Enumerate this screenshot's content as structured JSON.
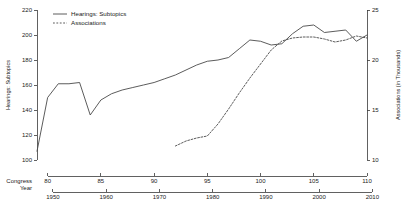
{
  "chart_data": {
    "type": "line",
    "title": "",
    "xlabel": "Congress",
    "ylabel": "Hearings: Subtopics",
    "y2label": "Associations (in Thousands)",
    "grid": false,
    "legend_position": "top-left",
    "x_axes": [
      {
        "name": "Congress",
        "label": "Congress",
        "ticks": [
          80,
          85,
          90,
          95,
          100,
          105,
          110
        ],
        "tick_labels": [
          "80",
          "85",
          "90",
          "95",
          "100",
          "105",
          "110"
        ],
        "range": [
          79,
          110
        ]
      },
      {
        "name": "Year",
        "label": "Year",
        "ticks": [
          1950,
          1960,
          1970,
          1980,
          1990,
          2000,
          2010
        ],
        "tick_labels": [
          "1950",
          "1960",
          "1970",
          "1980",
          "1990",
          "2000",
          "2010"
        ],
        "range": [
          1947,
          2009
        ]
      }
    ],
    "y_axis_left": {
      "label": "Hearings: Subtopics",
      "ticks": [
        100,
        120,
        140,
        160,
        180,
        200,
        220
      ],
      "tick_labels": [
        "100",
        "120",
        "140",
        "160",
        "180",
        "200",
        "220"
      ],
      "range": [
        100,
        220
      ]
    },
    "y_axis_right": {
      "label": "Associations (in Thousands)",
      "ticks": [
        10,
        15,
        20,
        25
      ],
      "tick_labels": [
        "10",
        "15",
        "20",
        "25"
      ],
      "range": [
        10,
        25
      ]
    },
    "series": [
      {
        "name": "Hearings: Subtopics",
        "style": "solid",
        "axis": "left",
        "color": "#4a4a4a",
        "x": [
          79,
          80,
          81,
          82,
          83,
          84,
          85,
          86,
          87,
          88,
          89,
          90,
          91,
          92,
          93,
          94,
          95,
          96,
          97,
          98,
          99,
          100,
          101,
          102,
          103,
          104,
          105,
          106,
          107,
          108,
          109,
          110
        ],
        "values": [
          107,
          150,
          161,
          161,
          162,
          136,
          148,
          153,
          156,
          158,
          160,
          162,
          165,
          168,
          172,
          176,
          179,
          180,
          182,
          189,
          196,
          195,
          192,
          193,
          201,
          207,
          208,
          202,
          203,
          204,
          195,
          200
        ]
      },
      {
        "name": "Associations",
        "style": "dashed",
        "axis": "right",
        "color": "#4a4a4a",
        "x": [
          92,
          93,
          94,
          95,
          96,
          97,
          98,
          99,
          100,
          101,
          102,
          103,
          104,
          105,
          106,
          107,
          108,
          109,
          110
        ],
        "values": [
          11.4,
          11.9,
          12.2,
          12.4,
          13.6,
          15.1,
          16.7,
          18.2,
          19.6,
          21.0,
          21.9,
          22.2,
          22.3,
          22.3,
          22.1,
          21.8,
          22.0,
          22.4,
          22.2
        ]
      }
    ],
    "legend": [
      {
        "label": "Hearings: Subtopics",
        "style": "solid"
      },
      {
        "label": "Associations",
        "style": "dashed"
      }
    ]
  }
}
